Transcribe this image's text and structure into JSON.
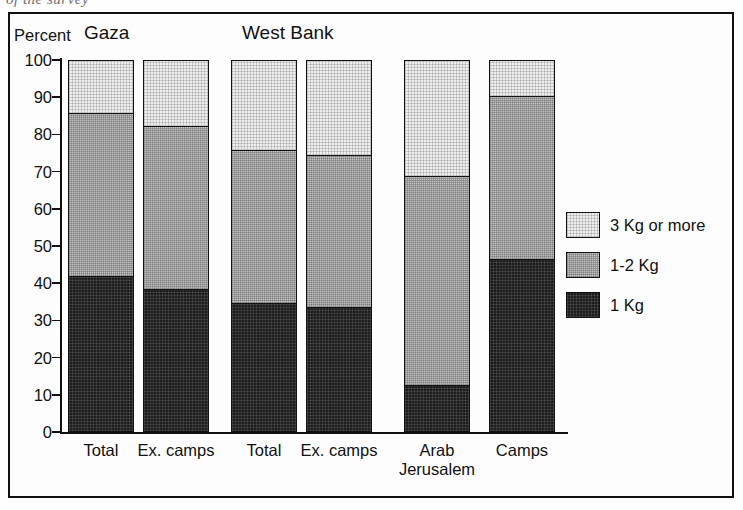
{
  "figure": {
    "clipped_text_above": "of the survey",
    "y_axis_title": "Percent",
    "group_titles": [
      "Gaza",
      "West Bank"
    ]
  },
  "legend": {
    "items": [
      {
        "label": "3 Kg or more",
        "key": "s3",
        "color": "#eeeeee"
      },
      {
        "label": "1-2 Kg",
        "key": "s2",
        "color": "#c2c2c2"
      },
      {
        "label": "1 Kg",
        "key": "s1",
        "color": "#1d1d1d"
      }
    ]
  },
  "chart_data": {
    "type": "bar",
    "subtype": "stacked",
    "title": "",
    "xlabel": "",
    "ylabel": "Percent",
    "ylim": [
      0,
      100
    ],
    "yticks": [
      0,
      10,
      20,
      30,
      40,
      50,
      60,
      70,
      80,
      90,
      100
    ],
    "grid": false,
    "legend_position": "right",
    "group_labels": [
      "Gaza",
      "West Bank",
      ""
    ],
    "categories": [
      "Total",
      "Ex. camps",
      "Total",
      "Ex. camps",
      "Arab Jerusalem",
      "Camps"
    ],
    "category_lines": [
      [
        "Total"
      ],
      [
        "Ex. camps"
      ],
      [
        "Total"
      ],
      [
        "Ex. camps"
      ],
      [
        "Arab",
        "Jerusalem"
      ],
      [
        "Camps"
      ]
    ],
    "series": [
      {
        "name": "1 Kg",
        "values": [
          42.0,
          38.5,
          34.5,
          33.5,
          12.5,
          46.5
        ]
      },
      {
        "name": "1-2 Kg",
        "values": [
          44.0,
          44.0,
          41.5,
          41.0,
          56.5,
          44.0
        ]
      },
      {
        "name": "3 Kg or more",
        "values": [
          14.0,
          17.5,
          24.0,
          25.5,
          31.0,
          9.5
        ]
      }
    ],
    "cumulative_tops": {
      "1 Kg": [
        42.0,
        38.5,
        34.5,
        33.5,
        12.5,
        46.5
      ],
      "1-2 Kg": [
        86.0,
        82.5,
        76.0,
        74.5,
        69.0,
        90.5
      ],
      "3 Kg or more": [
        100.0,
        100.0,
        100.0,
        100.0,
        100.0,
        100.0
      ]
    }
  }
}
